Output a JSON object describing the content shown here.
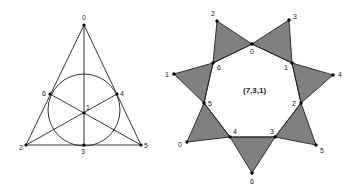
{
  "left_diagram": {
    "name": "fano-plane",
    "points": [
      {
        "label": "0",
        "x": 84,
        "y": 25,
        "lx": 82,
        "ly": 20
      },
      {
        "label": "1",
        "x": 84,
        "y": 113,
        "lx": 86,
        "ly": 110
      },
      {
        "label": "2",
        "x": 26,
        "y": 145,
        "lx": 19,
        "ly": 150
      },
      {
        "label": "3",
        "x": 84,
        "y": 145,
        "lx": 81,
        "ly": 154
      },
      {
        "label": "4",
        "x": 117,
        "y": 94,
        "lx": 120,
        "ly": 96
      },
      {
        "label": "5",
        "x": 141,
        "y": 145,
        "lx": 144,
        "ly": 148
      },
      {
        "label": "6",
        "x": 50,
        "y": 94,
        "lx": 42,
        "ly": 96
      }
    ],
    "circle": {
      "cx": 84,
      "cy": 110,
      "r": 36
    }
  },
  "right_diagram": {
    "title": "(7,3,1)",
    "inner": [
      {
        "label": "0",
        "x": 252,
        "y": 44,
        "lx": 250,
        "ly": 54
      },
      {
        "label": "1",
        "x": 292,
        "y": 63,
        "lx": 284,
        "ly": 70
      },
      {
        "label": "2",
        "x": 301,
        "y": 103,
        "lx": 292,
        "ly": 106
      },
      {
        "label": "3",
        "x": 275,
        "y": 137,
        "lx": 270,
        "ly": 134
      },
      {
        "label": "4",
        "x": 230,
        "y": 137,
        "lx": 233,
        "ly": 134
      },
      {
        "label": "5",
        "x": 204,
        "y": 103,
        "lx": 208,
        "ly": 106
      },
      {
        "label": "6",
        "x": 213,
        "y": 63,
        "lx": 217,
        "ly": 70
      }
    ],
    "outer": [
      {
        "label": "2",
        "x": 217,
        "y": 21,
        "lx": 211,
        "ly": 16
      },
      {
        "label": "3",
        "x": 289,
        "y": 20,
        "lx": 293,
        "ly": 19
      },
      {
        "label": "4",
        "x": 333,
        "y": 75,
        "lx": 338,
        "ly": 77
      },
      {
        "label": "5",
        "x": 316,
        "y": 145,
        "lx": 320,
        "ly": 153
      },
      {
        "label": "6",
        "x": 252,
        "y": 173,
        "lx": 250,
        "ly": 184
      },
      {
        "label": "0",
        "x": 187,
        "y": 142,
        "lx": 178,
        "ly": 147
      },
      {
        "label": "1",
        "x": 174,
        "y": 74,
        "lx": 165,
        "ly": 77
      }
    ],
    "triangles": [
      [
        "outer.0",
        "inner.6",
        "inner.0"
      ],
      [
        "outer.1",
        "inner.0",
        "inner.1"
      ],
      [
        "outer.2",
        "inner.1",
        "inner.2"
      ],
      [
        "outer.3",
        "inner.2",
        "inner.3"
      ],
      [
        "outer.4",
        "inner.3",
        "inner.4"
      ],
      [
        "outer.5",
        "inner.4",
        "inner.5"
      ],
      [
        "outer.6",
        "inner.5",
        "inner.6"
      ]
    ],
    "fill_color": "#808080"
  }
}
